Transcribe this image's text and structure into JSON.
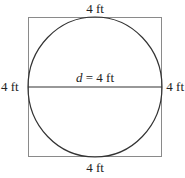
{
  "diagram": {
    "labels": {
      "top": "4 ft",
      "bottom": "4 ft",
      "left": "4 ft",
      "right": "4 ft",
      "diameter_var": "d",
      "diameter_rest": " = 4 ft"
    },
    "colors": {
      "square_stroke": "#8a8a8a",
      "circle_stroke": "#333333",
      "text": "#222222"
    }
  }
}
